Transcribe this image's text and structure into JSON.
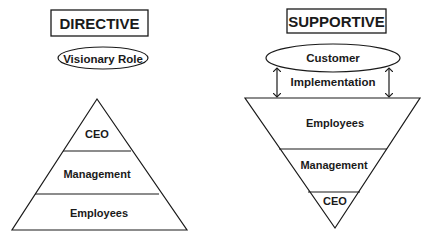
{
  "directive": {
    "title": "DIRECTIVE",
    "oval_label": "Visionary Role",
    "pyramid_levels": [
      "CEO",
      "Management",
      "Employees"
    ]
  },
  "supportive": {
    "title": "SUPPORTIVE",
    "oval_label": "Customer",
    "arrow_label": "Implementation",
    "pyramid_levels": [
      "Employees",
      "Management",
      "CEO"
    ]
  },
  "colors": {
    "stroke": "#1a1a1a",
    "background": "#ffffff"
  }
}
